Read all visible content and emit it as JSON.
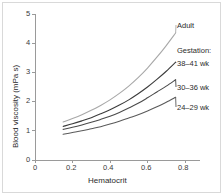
{
  "figure": {
    "background_color": "#ffffff",
    "frame_color": "#d9d9d9"
  },
  "chart_data": {
    "type": "line",
    "title": "",
    "subtitle": "",
    "xlabel": "Hematocrit",
    "ylabel": "Blood viscosity (mPa s)",
    "xlim": [
      0,
      0.88
    ],
    "ylim": [
      0,
      5
    ],
    "xticks": [
      0,
      0.2,
      0.4,
      0.6,
      0.8
    ],
    "xticklabels": [
      "0",
      "0.2",
      "0.4",
      "0.6",
      "0.8"
    ],
    "yticks": [
      0,
      1,
      2,
      3,
      4,
      5
    ],
    "yticklabels": [
      "0",
      "1",
      "2",
      "3",
      "4",
      "5"
    ],
    "grid": false,
    "legend_position": "inline-right-of-curves",
    "legend_group_title": "Gestation:",
    "x": [
      0.15,
      0.2,
      0.25,
      0.3,
      0.35,
      0.4,
      0.45,
      0.5,
      0.55,
      0.6,
      0.65,
      0.7,
      0.75
    ],
    "series": [
      {
        "name": "Adult",
        "color": "#a8a8a8",
        "linewidth": 1.1,
        "label": "Adult",
        "values": [
          1.3,
          1.42,
          1.55,
          1.7,
          1.87,
          2.06,
          2.28,
          2.53,
          2.82,
          3.15,
          3.52,
          3.92,
          4.35
        ]
      },
      {
        "name": "38-41 wk",
        "color": "#3c3c3c",
        "linewidth": 1.1,
        "label": "38–41 wk",
        "values": [
          1.15,
          1.24,
          1.34,
          1.45,
          1.58,
          1.72,
          1.88,
          2.06,
          2.27,
          2.5,
          2.76,
          3.04,
          3.35
        ]
      },
      {
        "name": "30-36 wk",
        "color": "#4a4a4a",
        "linewidth": 1.1,
        "label": "30–36 wk",
        "values": [
          1.05,
          1.12,
          1.2,
          1.29,
          1.39,
          1.5,
          1.63,
          1.78,
          1.94,
          2.13,
          2.33,
          2.53,
          2.75
        ]
      },
      {
        "name": "24-29 wk",
        "color": "#5a5a5a",
        "linewidth": 1.1,
        "label": "24–29 wk",
        "values": [
          0.88,
          0.94,
          1.0,
          1.07,
          1.14,
          1.23,
          1.33,
          1.44,
          1.55,
          1.68,
          1.82,
          1.98,
          2.15
        ]
      }
    ]
  },
  "axes": {
    "x_axis_color": "#9a9a9a",
    "y_axis_color": "#9a9a9a"
  }
}
